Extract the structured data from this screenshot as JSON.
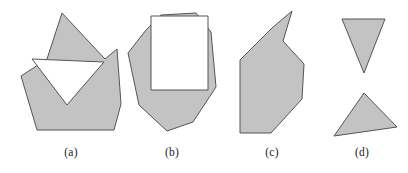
{
  "figure": {
    "background_color": "#ffffff",
    "fill_color": "#c3c3c3",
    "stroke_color": "#555555",
    "hole_fill_color": "#ffffff",
    "caption_color": "#1a1a1a"
  },
  "captions": {
    "a": "(a)",
    "b": "(b)",
    "c": "(c)",
    "d": "(d)"
  },
  "shapes": {
    "a": {
      "label": "(a)",
      "name": "polygon-with-triangular-notch",
      "outline_points": "47,59 62,13 105,59 117,49 121,104 114,130 37,130 21,76",
      "notch_points": "32,59 104,62 67,105"
    },
    "b": {
      "label": "(b)",
      "name": "polygon-with-rectangular-hole",
      "outline_points": "146,30 161,15 196,13 211,32 216,87 193,122 167,131 139,105 128,53",
      "hole_points": "151,16 208,16 208,90 151,90"
    },
    "c": {
      "label": "(c)",
      "name": "polygon-with-spike",
      "outline_points": "292,11 283,41 304,64 302,99 271,133 240,133 240,60 272,28"
    },
    "d": {
      "label": "(d)",
      "name": "two-separate-triangles",
      "triangle_top_points": "342,19 385,19 364,73",
      "triangle_bottom_points": "364,93 397,127 334,136"
    }
  }
}
